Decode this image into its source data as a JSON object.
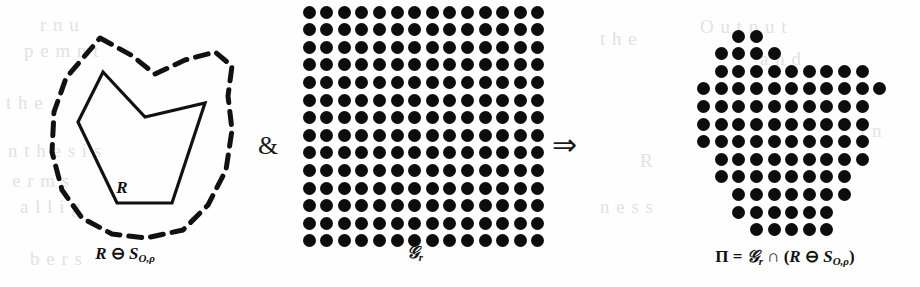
{
  "figure": {
    "type": "morphological-erosion-diagram",
    "background_color": "#fefefe",
    "ink_color": "#0d0d0d"
  },
  "panels": {
    "left": {
      "name": "eroded-region",
      "caption_main": "R",
      "caption_op": " ⊖ ",
      "caption_sub_base": "S",
      "caption_sub_script": "O,ρ",
      "inner_label": "R",
      "solid_polygon_points": "103,72 145,117 205,103 172,203 117,203 78,122",
      "dashed_outline_points": "100,38 131,55 155,74 185,60 215,52 232,66 228,96 232,130 226,170 208,205 183,230 146,238 112,234 82,218 62,190 52,152 54,112 66,78",
      "solid_stroke_width": 3.2,
      "dashed_stroke_width": 5.0,
      "dash_pattern": "13 9"
    },
    "middle": {
      "name": "regular-grid",
      "caption_main": "𝒢",
      "caption_sub": "r",
      "rows": 14,
      "cols": 14,
      "spacing": 17.6,
      "origin_x": 309,
      "origin_y": 12,
      "dot_diameter": 13
    },
    "right": {
      "name": "grid-region-intersection",
      "caption_prefix": "Π",
      "caption_eq": " = ",
      "caption_grid": "𝒢",
      "caption_grid_sub": "r",
      "caption_cap": " ∩ (",
      "caption_R": "R",
      "caption_minus": " ⊖ ",
      "caption_S": "S",
      "caption_S_sub": "O,ρ",
      "caption_close": ")",
      "origin_x": 686,
      "origin_y": 36,
      "spacing": 17.6,
      "dot_diameter": 13,
      "rows": [
        [
          3,
          4
        ],
        [
          2,
          3,
          4,
          5
        ],
        [
          2,
          3,
          4,
          5,
          6,
          7,
          8,
          9,
          10
        ],
        [
          1,
          2,
          3,
          4,
          5,
          6,
          7,
          8,
          9,
          10,
          11
        ],
        [
          1,
          2,
          3,
          4,
          5,
          6,
          7,
          8,
          9,
          10
        ],
        [
          1,
          2,
          3,
          4,
          5,
          6,
          7,
          8,
          9,
          10
        ],
        [
          1,
          2,
          3,
          4,
          5,
          6,
          7,
          8,
          9,
          10
        ],
        [
          2,
          3,
          4,
          5,
          6,
          7,
          8,
          9,
          10
        ],
        [
          2,
          3,
          4,
          5,
          6,
          7,
          8,
          9
        ],
        [
          3,
          4,
          5,
          6,
          7,
          8,
          9
        ],
        [
          3,
          4,
          5,
          6,
          7,
          8
        ],
        [
          4,
          5,
          6,
          7,
          8
        ]
      ]
    }
  },
  "operators": {
    "ampersand": "&",
    "implies": "⇒"
  },
  "bleed_through_text": [
    {
      "text": "r  n  u",
      "x": 40,
      "y": 14
    },
    {
      "text": "p  e  m  n  t",
      "x": 24,
      "y": 40
    },
    {
      "text": "t  h  e",
      "x": 6,
      "y": 92
    },
    {
      "text": "n  t  h  e  s  i  s",
      "x": 8,
      "y": 140
    },
    {
      "text": "e  r  m  s",
      "x": 12,
      "y": 170
    },
    {
      "text": "a  l  l  i  g",
      "x": 20,
      "y": 196
    },
    {
      "text": "b  e  r  s",
      "x": 30,
      "y": 248
    },
    {
      "text": "t  h  e",
      "x": 600,
      "y": 28
    },
    {
      "text": "R",
      "x": 640,
      "y": 150
    },
    {
      "text": "n  e  s  s",
      "x": 600,
      "y": 196
    },
    {
      "text": "O  u  t  p  u  t",
      "x": 700,
      "y": 16
    },
    {
      "text": "a  n  d",
      "x": 760,
      "y": 48
    },
    {
      "text": "i  n",
      "x": 860,
      "y": 120
    }
  ]
}
